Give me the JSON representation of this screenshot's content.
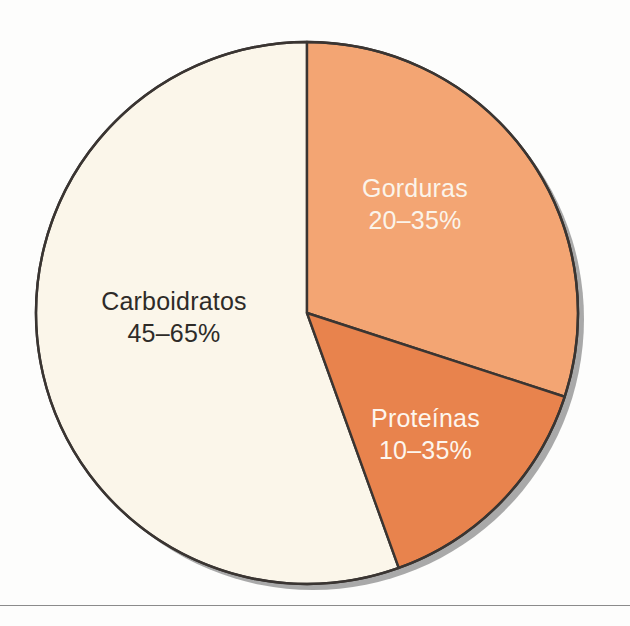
{
  "figure": {
    "background_color": "#fdfdfc",
    "baseline_rule_color": "#8b8b8b"
  },
  "chart_data": {
    "type": "pie",
    "title": "",
    "subtitle": "",
    "xlabel": "",
    "ylabel": "",
    "legend_position": "none",
    "grid": false,
    "labels_inside_slices": true,
    "start_angle_deg": 0,
    "direction": "clockwise",
    "categories": [
      "Gorduras",
      "Proteínas",
      "Carboidratos"
    ],
    "values": [
      30,
      14.5,
      55.5
    ],
    "value_labels": [
      "20–35%",
      "10–35%",
      "45–65%"
    ],
    "colors": [
      "#f3a573",
      "#e8834d",
      "#fbf6ea"
    ],
    "slices": [
      {
        "name": "Gorduras",
        "value_label": "20–35%",
        "range_min_pct": 20,
        "range_max_pct": 35,
        "share_pct": 30,
        "start_angle_deg": 0,
        "end_angle_deg": 108,
        "color": "#f3a573",
        "text_color": "#fbf4ea"
      },
      {
        "name": "Proteínas",
        "value_label": "10–35%",
        "range_min_pct": 10,
        "range_max_pct": 35,
        "share_pct": 14.5,
        "start_angle_deg": 108,
        "end_angle_deg": 160.2,
        "color": "#e8834d",
        "text_color": "#fdf6ee"
      },
      {
        "name": "Carboidratos",
        "value_label": "45–65%",
        "range_min_pct": 45,
        "range_max_pct": 65,
        "share_pct": 55.5,
        "start_angle_deg": 160.2,
        "end_angle_deg": 360,
        "color": "#fbf6ea",
        "text_color": "#2e2b28"
      }
    ],
    "geometry": {
      "center_x": 307,
      "center_y": 313,
      "radius": 271,
      "outline_color": "#3a3532",
      "shadow_color": "#9a9a9a"
    }
  }
}
